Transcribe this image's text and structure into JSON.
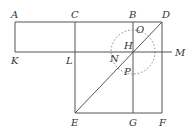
{
  "diagram": {
    "type": "geometric-construction",
    "labels": {
      "A": "A",
      "B": "B",
      "C": "C",
      "D": "D",
      "E": "E",
      "F": "F",
      "G": "G",
      "H": "H",
      "K": "K",
      "L": "L",
      "M": "M",
      "N": "N",
      "O": "O",
      "P": "P"
    },
    "points": {
      "A": [
        15,
        22
      ],
      "C": [
        75,
        22
      ],
      "B": [
        133,
        22
      ],
      "D": [
        162,
        22
      ],
      "K": [
        15,
        52
      ],
      "L": [
        75,
        52
      ],
      "H": [
        133,
        52
      ],
      "M": [
        172,
        52
      ],
      "E": [
        75,
        113
      ],
      "G": [
        133,
        113
      ],
      "F": [
        162,
        113
      ]
    },
    "circle": {
      "center": "H",
      "radius": 22,
      "style": "dotted"
    },
    "colors": {
      "line": "#555555",
      "text": "#333333",
      "background": "#ffffff"
    }
  }
}
